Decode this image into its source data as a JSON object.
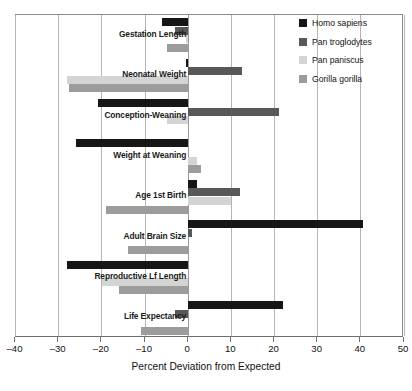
{
  "chart_data": {
    "type": "bar",
    "orientation": "horizontal",
    "title": "",
    "xlabel": "Percent Deviation from Expected",
    "ylabel": "",
    "xlim": [
      -40,
      50
    ],
    "xticks": [
      -40,
      -30,
      -20,
      -10,
      0,
      10,
      20,
      30,
      40,
      50
    ],
    "xtick_labels": [
      "–40",
      "–30",
      "–20",
      "–10",
      "0",
      "10",
      "20",
      "30",
      "40",
      "50"
    ],
    "grid": true,
    "legend_position": "top-right",
    "categories": [
      "Gestation Length",
      "Neonatal Weight",
      "Conception-Weaning",
      "Weight at Weaning",
      "Age 1st Birth",
      "Adult Brain Size",
      "Reproductive Lf Length",
      "Life Expectancy"
    ],
    "series": [
      {
        "name": "Homo sapiens",
        "color": "#161616",
        "values": [
          -6.0,
          -0.5,
          -21.0,
          -26.0,
          2.0,
          40.5,
          -28.0,
          22.0
        ]
      },
      {
        "name": "Pan troglodytes",
        "color": "#585858",
        "values": [
          -3.0,
          12.5,
          21.0,
          0.0,
          12.0,
          1.0,
          0.0,
          -3.0
        ]
      },
      {
        "name": "Pan paniscus",
        "color": "#d4d4d4",
        "values": [
          -0.5,
          -28.0,
          -5.0,
          2.0,
          10.0,
          0.0,
          -20.0,
          0.0
        ]
      },
      {
        "name": "Gorilla gorilla",
        "color": "#9c9c9c",
        "values": [
          -5.0,
          -27.5,
          0.0,
          3.0,
          -19.0,
          -14.0,
          -16.0,
          -11.0
        ]
      }
    ]
  },
  "legend": {
    "items": [
      {
        "label": "Homo sapiens",
        "color": "#161616",
        "swatch_name": "legend-swatch-homo-sapiens"
      },
      {
        "label": "Pan troglodytes",
        "color": "#585858",
        "swatch_name": "legend-swatch-pan-troglodytes"
      },
      {
        "label": "Pan paniscus",
        "color": "#d4d4d4",
        "swatch_name": "legend-swatch-pan-paniscus"
      },
      {
        "label": "Gorilla gorilla",
        "color": "#9c9c9c",
        "swatch_name": "legend-swatch-gorilla-gorilla"
      }
    ]
  },
  "axis": {
    "x_title": "Percent Deviation from Expected"
  },
  "colors": {
    "grid": "#b4b4b4",
    "frame": "#8c8c8c",
    "axis": "#6f6f6f",
    "background": "#ffffff",
    "text": "#111111"
  }
}
